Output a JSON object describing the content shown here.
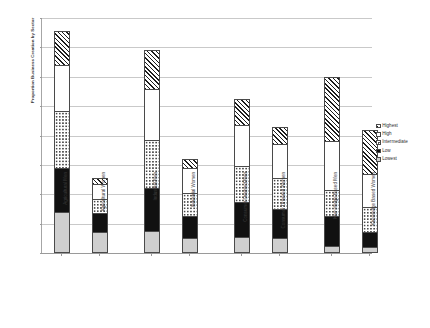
{
  "chart_data": {
    "type": "bar",
    "subtype": "stacked-bar",
    "title": "",
    "xlabel": "",
    "ylabel": "Proportion Business Creation by Sector",
    "ylim": [
      0,
      80
    ],
    "ytick_labels": [
      "0%",
      "10%",
      "20%",
      "30%",
      "40%",
      "50%",
      "60%",
      "70%",
      "80%"
    ],
    "ytick_values": [
      0,
      10,
      20,
      30,
      40,
      50,
      60,
      70,
      80
    ],
    "grid": true,
    "legend_position": "right",
    "categories": [
      "Agricultural  Men",
      "Agricultural  Women",
      "Industrial  Men",
      "Industrial  Women",
      "Consumer Oriented  Men",
      "Consumer Oriented  Women",
      "Knowledge Based  Men",
      "Knowledge Based  Women"
    ],
    "series": [
      {
        "name": "Lowest",
        "pattern": "light-gray-solid",
        "values": [
          14.0,
          7.0,
          7.5,
          5.0,
          5.5,
          5.0,
          2.5,
          2.0
        ]
      },
      {
        "name": "Low",
        "pattern": "black-solid",
        "values": [
          15.0,
          6.5,
          14.5,
          7.5,
          12.0,
          10.0,
          10.0,
          5.0
        ]
      },
      {
        "name": "Intermediate",
        "pattern": "checkered",
        "values": [
          19.5,
          5.0,
          16.5,
          8.0,
          12.0,
          10.5,
          9.0,
          8.5
        ]
      },
      {
        "name": "High",
        "pattern": "white-empty",
        "values": [
          15.5,
          5.0,
          17.5,
          8.5,
          14.0,
          11.5,
          16.5,
          11.5
        ]
      },
      {
        "name": "Highest",
        "pattern": "diagonal-hatch",
        "values": [
          11.5,
          2.0,
          13.0,
          3.0,
          9.0,
          6.0,
          22.0,
          15.0
        ]
      }
    ],
    "totals": [
      75.5,
      25.5,
      69.0,
      32.0,
      52.5,
      43.0,
      60.0,
      42.0
    ],
    "legend_order": [
      "Highest",
      "High",
      "Intermediate",
      "Low",
      "Lowest"
    ]
  }
}
